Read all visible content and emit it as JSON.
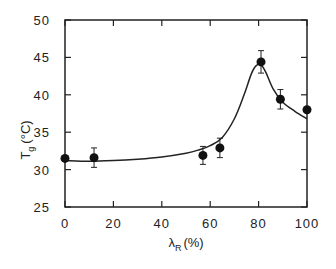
{
  "chart_data": {
    "type": "scatter",
    "title": "",
    "xlabel": "λR (%)",
    "xlabel_main": "λ",
    "xlabel_sub": "R",
    "xlabel_unit": "(%)",
    "ylabel": "Tg (°C)",
    "ylabel_main": "T",
    "ylabel_sub": "g",
    "ylabel_unit": "(°C)",
    "xlim": [
      0,
      100
    ],
    "ylim": [
      25,
      50
    ],
    "xticks": [
      "0",
      "20",
      "40",
      "60",
      "80",
      "100"
    ],
    "yticks": [
      "25",
      "30",
      "35",
      "40",
      "45",
      "50"
    ],
    "grid": false,
    "legend": null,
    "series": [
      {
        "name": "measured",
        "marker": "filled-circle",
        "x": [
          0,
          12,
          57,
          64,
          81,
          89,
          100
        ],
        "y": [
          31.5,
          31.6,
          31.9,
          32.9,
          44.4,
          39.4,
          38.0
        ],
        "yerr": [
          0,
          1.3,
          1.2,
          1.3,
          1.5,
          1.3,
          0
        ]
      },
      {
        "name": "fit",
        "style": "line",
        "x": [
          0,
          10,
          20,
          30,
          40,
          50,
          55,
          60,
          65,
          70,
          74,
          77,
          79,
          81,
          83,
          86,
          90,
          95,
          100
        ],
        "y": [
          31.2,
          31.1,
          31.2,
          31.4,
          31.7,
          32.2,
          32.6,
          33.2,
          34.3,
          36.8,
          40.0,
          42.8,
          43.9,
          44.0,
          43.0,
          40.8,
          39.0,
          37.8,
          36.8
        ]
      }
    ]
  }
}
